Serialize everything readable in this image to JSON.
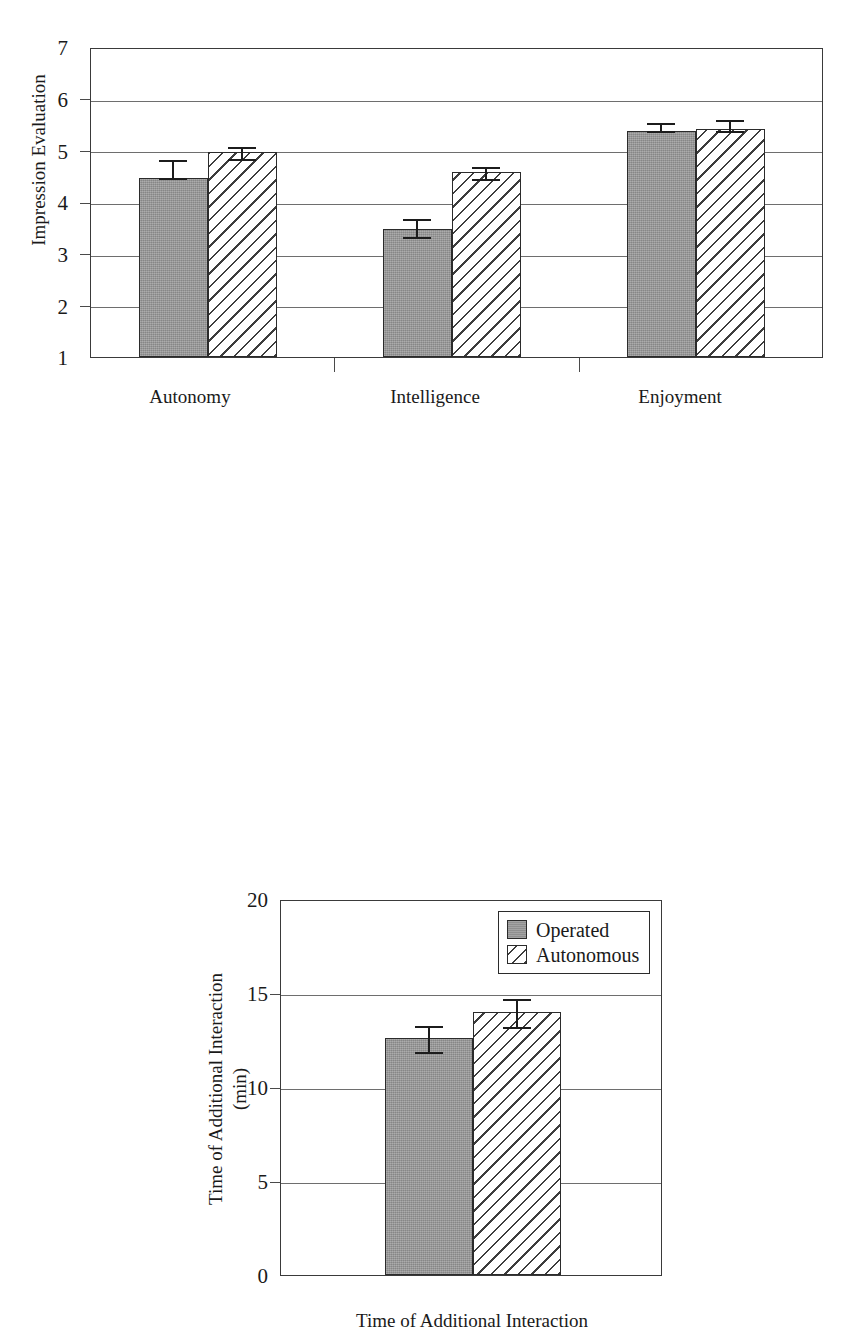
{
  "figure": {
    "panels": [
      "impression-evaluation-chart",
      "time-of-additional-interaction-chart"
    ]
  },
  "legend": {
    "entries": [
      {
        "label": "Operated",
        "pattern": "solid-gray",
        "color": "#9a9a9a"
      },
      {
        "label": "Autonomous",
        "pattern": "diagonal-hatch",
        "color": "#ffffff"
      }
    ]
  },
  "chart_data": [
    {
      "id": "impression-evaluation",
      "type": "bar",
      "title": "",
      "xlabel": "",
      "ylabel": "Impression Evaluation",
      "categories": [
        "Autonomy",
        "Intelligence",
        "Enjoyment"
      ],
      "ylim": [
        1,
        7
      ],
      "yticks": [
        1,
        2,
        3,
        4,
        5,
        6,
        7
      ],
      "ytick_labels": [
        "1",
        "2",
        "3",
        "4",
        "5",
        "6",
        "7"
      ],
      "grid": true,
      "legend_position": "none",
      "series": [
        {
          "name": "Operated",
          "pattern": "solid-gray",
          "values": [
            4.47,
            3.48,
            5.38
          ],
          "errors": [
            0.19,
            0.2,
            0.1
          ]
        },
        {
          "name": "Autonomous",
          "pattern": "diagonal-hatch",
          "values": [
            4.97,
            4.58,
            5.42
          ],
          "errors": [
            0.13,
            0.13,
            0.12
          ]
        }
      ]
    },
    {
      "id": "time-of-additional-interaction",
      "type": "bar",
      "title": "",
      "xlabel": "Time of Additional Interaction",
      "ylabel_line1": "Time of Additional Interaction",
      "ylabel_line2": "(min)",
      "categories": [
        "Time of Additional Interaction"
      ],
      "ylim": [
        0,
        20
      ],
      "yticks": [
        0,
        5,
        10,
        15,
        20
      ],
      "ytick_labels": [
        "0",
        "5",
        "10",
        "15",
        "20"
      ],
      "grid": true,
      "legend_position": "top-right",
      "series": [
        {
          "name": "Operated",
          "pattern": "solid-gray",
          "values": [
            12.6
          ],
          "errors": [
            0.75
          ]
        },
        {
          "name": "Autonomous",
          "pattern": "diagonal-hatch",
          "values": [
            14.0
          ],
          "errors": [
            0.8
          ]
        }
      ]
    }
  ]
}
